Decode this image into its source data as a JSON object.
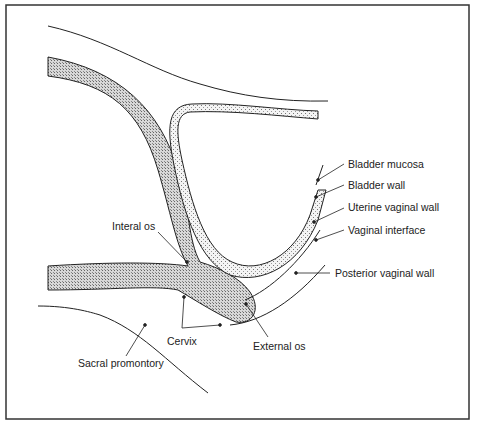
{
  "diagram": {
    "type": "anatomical cross-section (sagittal)",
    "labels": {
      "bladder_mucosa": "Bladder mucosa",
      "bladder_wall": "Bladder wall",
      "uterine_vaginal_wall": "Uterine vaginal wall",
      "vaginal_interface": "Vaginal interface",
      "posterior_vaginal_wall": "Posterior vaginal wall",
      "internal_os": "Interal os",
      "cervix": "Cervix",
      "external_os": "External os",
      "sacral_promontory": "Sacral promontory"
    },
    "colors": {
      "line": "#222222",
      "uterus_fill": "#c8c8c8",
      "bladder_fill": "#e4e4e4",
      "frame": "#333333"
    }
  }
}
